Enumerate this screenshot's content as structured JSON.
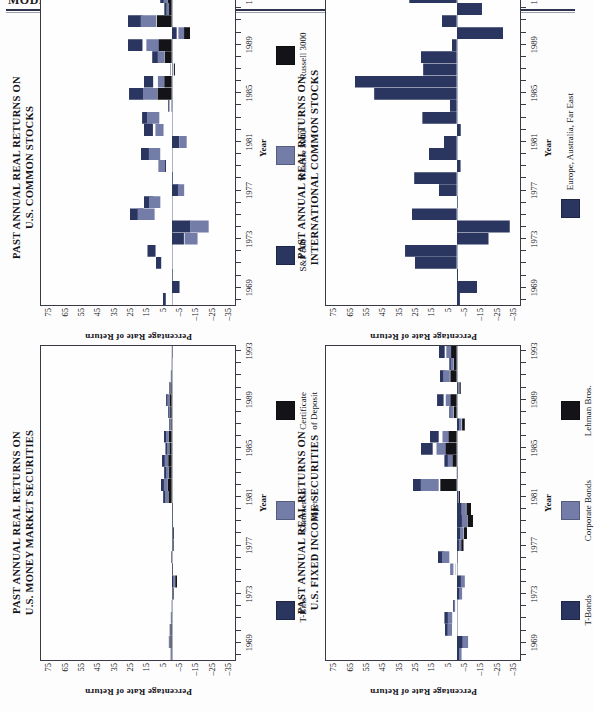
{
  "page": {
    "running_head": "MODEL PORTFOLIOS",
    "rule_color": "#2e3350",
    "background": "#fdfdfd"
  },
  "palette": {
    "navy": "#2a3560",
    "slate": "#737da8",
    "black": "#141418",
    "axis": "#3a3a46"
  },
  "shared": {
    "ylabel": "Percentage Rate of Return",
    "xlabel": "Year",
    "yticks": [
      "75",
      "65",
      "55",
      "45",
      "35",
      "25",
      "15",
      "5",
      "–5",
      "–15",
      "–25",
      "–35"
    ],
    "xticks": [
      "1969",
      "1973",
      "1977",
      "1981",
      "1985",
      "1989",
      "1993"
    ]
  },
  "chart_data": [
    {
      "id": "us-common-stocks",
      "type": "bar",
      "title_line1": "PAST ANNUAL REAL RETURNS ON",
      "title_line2": "U.S. COMMON STOCKS",
      "xlabel": "Year",
      "ylabel": "Percentage Rate of Return",
      "ylim": [
        -40,
        80
      ],
      "yticks": [
        75,
        65,
        55,
        45,
        35,
        25,
        15,
        5,
        -5,
        -15,
        -25,
        -35
      ],
      "grid": false,
      "legend_position": "bottom",
      "x": [
        1968,
        1969,
        1970,
        1971,
        1972,
        1973,
        1974,
        1975,
        1976,
        1977,
        1978,
        1979,
        1980,
        1981,
        1982,
        1983,
        1984,
        1985,
        1986,
        1987,
        1988,
        1989,
        1990,
        1991,
        1992,
        1993
      ],
      "categories": [
        "1968",
        "1969",
        "1970",
        "1971",
        "1972",
        "1973",
        "1974",
        "1975",
        "1976",
        "1977",
        "1978",
        "1979",
        "1980",
        "1981",
        "1982",
        "1983",
        "1984",
        "1985",
        "1986",
        "1987",
        "1988",
        "1989",
        "1990",
        "1991",
        "1992",
        "1993"
      ],
      "series": [
        {
          "name": "S&P 500",
          "color": "#2a3560",
          "values": [
            5.4,
            -14.5,
            -1.5,
            9.6,
            14.8,
            -22.5,
            -34.5,
            25.8,
            17.0,
            -13.3,
            -2.2,
            5.2,
            18.8,
            -13.6,
            17.2,
            18.1,
            2.1,
            26.1,
            17.0,
            1.1,
            11.9,
            26.8,
            -9.2,
            26.8,
            4.5,
            7.0
          ]
        },
        {
          "name": "Wilshire 5000",
          "color": "#737da8",
          "values": [
            null,
            null,
            null,
            null,
            null,
            -23.8,
            -34.0,
            31.3,
            20.8,
            -11.5,
            -1.0,
            12.2,
            21.0,
            -13.8,
            14.9,
            22.7,
            -0.5,
            26.3,
            12.6,
            -1.0,
            12.9,
            23.2,
            -12.4,
            28.5,
            4.4,
            7.5
          ]
        },
        {
          "name": "Russell 3000",
          "color": "#141418",
          "values": [
            null,
            null,
            null,
            null,
            null,
            null,
            null,
            null,
            null,
            null,
            null,
            null,
            null,
            null,
            null,
            null,
            0.6,
            25.8,
            13.2,
            -2.0,
            12.4,
            23.6,
            -11.5,
            27.2,
            4.8,
            7.2
          ]
        }
      ],
      "legend": [
        {
          "label": "S&P 500",
          "color": "#2a3560"
        },
        {
          "label": "Wilshire 5000",
          "color": "#737da8"
        },
        {
          "label": "Russell 3000",
          "color": "#141418"
        }
      ]
    },
    {
      "id": "international-common-stocks",
      "type": "bar",
      "title_line1": "PAST ANNUAL REAL RETURNS ON",
      "title_line2": "INTERNATIONAL COMMON STOCKS",
      "xlabel": "Year",
      "ylabel": "Percentage Rate of Return",
      "ylim": [
        -40,
        80
      ],
      "yticks": [
        75,
        65,
        55,
        45,
        35,
        25,
        15,
        5,
        -5,
        -15,
        -25,
        -35
      ],
      "grid": false,
      "legend_position": "bottom",
      "categories": [
        "1968",
        "1969",
        "1970",
        "1971",
        "1972",
        "1973",
        "1974",
        "1975",
        "1976",
        "1977",
        "1978",
        "1979",
        "1980",
        "1981",
        "1982",
        "1983",
        "1984",
        "1985",
        "1986",
        "1987",
        "1988",
        "1989",
        "1990",
        "1991",
        "1992",
        "1993"
      ],
      "series": [
        {
          "name": "Europe, Australia, Far East",
          "color": "#2a3560",
          "values": [
            -2.0,
            -12.5,
            -0.8,
            25.6,
            31.6,
            -19.5,
            -32.5,
            27.4,
            -0.5,
            11.0,
            26.0,
            -2.4,
            17.0,
            8.0,
            -2.5,
            21.0,
            4.2,
            50.5,
            62.5,
            20.5,
            22.0,
            3.0,
            -28.5,
            9.2,
            -15.5,
            29.0
          ]
        }
      ],
      "legend": [
        {
          "label": "Europe, Australia, Far East",
          "color": "#2a3560"
        }
      ]
    },
    {
      "id": "us-money-market",
      "type": "bar",
      "title_line1": "PAST ANNUAL REAL RETURNS ON",
      "title_line2": "U.S. MONEY MARKET SECURITIES",
      "xlabel": "Year",
      "ylabel": "Percentage Rate of Return",
      "ylim": [
        -40,
        80
      ],
      "yticks": [
        75,
        65,
        55,
        45,
        35,
        25,
        15,
        5,
        -5,
        -15,
        -25,
        -35
      ],
      "grid": false,
      "legend_position": "bottom",
      "categories": [
        "1968",
        "1969",
        "1970",
        "1971",
        "1972",
        "1973",
        "1974",
        "1975",
        "1976",
        "1977",
        "1978",
        "1979",
        "1980",
        "1981",
        "1982",
        "1983",
        "1984",
        "1985",
        "1986",
        "1987",
        "1988",
        "1989",
        "1990",
        "1991",
        "1992",
        "1993"
      ],
      "series": [
        {
          "name": "T-Bills",
          "color": "#2a3560",
          "values": [
            0.5,
            1.8,
            1.1,
            0.4,
            0.1,
            -1.6,
            -3.8,
            -1.1,
            0.3,
            -1.4,
            -1.7,
            -1.6,
            -1.1,
            5.2,
            6.6,
            4.6,
            5.9,
            3.8,
            4.7,
            1.5,
            2.4,
            3.4,
            1.7,
            0.4,
            0.1,
            -0.1
          ]
        },
        {
          "name": "Commercial Paper",
          "color": "#737da8",
          "values": [
            1.0,
            2.6,
            1.9,
            0.8,
            0.4,
            -1.0,
            -3.0,
            -0.7,
            0.7,
            -1.0,
            -1.2,
            -0.9,
            -0.3,
            6.1,
            7.2,
            5.1,
            6.5,
            4.3,
            5.1,
            2.0,
            3.0,
            4.1,
            2.3,
            0.8,
            0.4,
            0.2
          ]
        },
        {
          "name": "Certificate\nof Deposit",
          "color": "#141418",
          "values": [
            0.8,
            2.2,
            1.6,
            0.6,
            0.2,
            -1.2,
            -3.3,
            -0.9,
            0.5,
            -1.2,
            -1.4,
            -1.1,
            -0.6,
            5.7,
            6.9,
            4.8,
            6.2,
            4.0,
            4.9,
            1.7,
            2.7,
            3.8,
            2.0,
            0.6,
            0.2,
            0.0
          ]
        }
      ],
      "legend": [
        {
          "label": "T-Bills",
          "color": "#2a3560"
        },
        {
          "label": "Commercial\nPaper",
          "color": "#737da8"
        },
        {
          "label": "Certificate\nof Deposit",
          "color": "#141418"
        }
      ]
    },
    {
      "id": "us-fixed-income",
      "type": "bar",
      "title_line1": "PAST ANNUAL REAL RETURNS ON",
      "title_line2": "U.S. FIXED INCOME SECURITIES",
      "xlabel": "Year",
      "ylabel": "Percentage Rate of Return",
      "ylim": [
        -40,
        80
      ],
      "yticks": [
        75,
        65,
        55,
        45,
        35,
        25,
        15,
        5,
        -5,
        -15,
        -25,
        -35
      ],
      "grid": false,
      "legend_position": "bottom",
      "categories": [
        "1968",
        "1969",
        "1970",
        "1971",
        "1972",
        "1973",
        "1974",
        "1975",
        "1976",
        "1977",
        "1978",
        "1979",
        "1980",
        "1981",
        "1982",
        "1983",
        "1984",
        "1985",
        "1986",
        "1987",
        "1988",
        "1989",
        "1990",
        "1991",
        "1992",
        "1993"
      ],
      "series": [
        {
          "name": "T-Bonds",
          "color": "#2a3560",
          "values": [
            -5.3,
            -11.5,
            7.4,
            7.5,
            2.2,
            -5.7,
            -8.5,
            1.3,
            11.5,
            -4.9,
            -7.0,
            -10.5,
            -9.7,
            -2.5,
            27.0,
            -0.3,
            7.5,
            22.0,
            16.5,
            -5.5,
            4.5,
            12.0,
            -3.0,
            10.5,
            4.5,
            11.0
          ]
        },
        {
          "name": "Corporate Bonds",
          "color": "#737da8",
          "values": [
            -4.5,
            -10.5,
            8.5,
            8.2,
            2.8,
            -5.0,
            -7.5,
            6.0,
            13.5,
            -4.0,
            -6.2,
            -9.5,
            -8.5,
            -2.0,
            33.0,
            0.5,
            8.2,
            18.5,
            13.0,
            -4.5,
            6.0,
            10.0,
            -2.0,
            12.5,
            5.5,
            9.5
          ]
        },
        {
          "name": "Lehman Bros.",
          "color": "#141418",
          "values": [
            null,
            null,
            null,
            null,
            null,
            null,
            null,
            null,
            -0.5,
            -4.2,
            -6.6,
            -10.0,
            -9.0,
            -2.2,
            30.0,
            0.1,
            7.8,
            20.0,
            14.5,
            -5.0,
            5.2,
            11.0,
            -2.5,
            11.5,
            5.0,
            10.2
          ]
        }
      ],
      "legend": [
        {
          "label": "T-Bonds",
          "color": "#2a3560"
        },
        {
          "label": "Corporate Bonds",
          "color": "#737da8"
        },
        {
          "label": "Lehman Bros.",
          "color": "#141418"
        }
      ]
    }
  ]
}
